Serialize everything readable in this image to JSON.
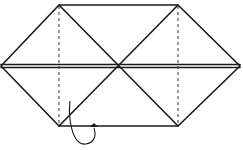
{
  "diagram": {
    "type": "origami-fold-step",
    "colors": {
      "line": "#1a1a1a",
      "background": "#ffffff"
    },
    "shape": {
      "top_edge": [
        [
          59,
          5
        ],
        [
          178,
          5
        ]
      ],
      "bottom_edge": [
        [
          59,
          126
        ],
        [
          178,
          126
        ]
      ],
      "left_vertex": [
        1,
        66
      ],
      "right_vertex": [
        240,
        66
      ],
      "center": [
        117,
        66
      ]
    },
    "dashed_lines_x": [
      59,
      178
    ],
    "arrow": {
      "kind": "fold-behind",
      "label": ""
    }
  }
}
